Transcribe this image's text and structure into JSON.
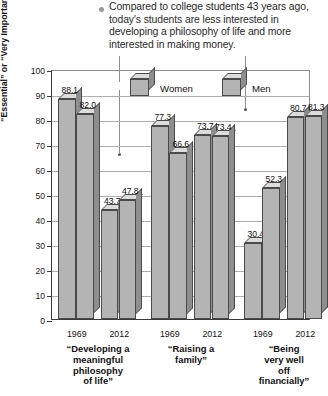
{
  "caption": {
    "bullet_icon": "bullet-dot",
    "text": "Compared to college students 43 years ago, today's students are less interested in developing a philosophy of life and more interested in making money."
  },
  "chart_data": {
    "type": "bar",
    "title": "",
    "xlabel": "",
    "ylabel": "Percentage Calling Objective “Essential” or “Very Important”",
    "ylabel_line1": "Percentage Calling Objective",
    "ylabel_line2": "“Essential” or “Very Important”",
    "ylim": [
      0,
      100
    ],
    "ytick_step": 10,
    "yticks": [
      "100",
      "90",
      "80",
      "70",
      "60",
      "50",
      "40",
      "30",
      "20",
      "10",
      "0"
    ],
    "grid": true,
    "legend_position": "top-inside",
    "legend": [
      "Women",
      "Men"
    ],
    "groups": [
      {
        "label": "“Developing a meaningful philosophy of life”",
        "label_lines": [
          "“Developing a",
          "meaningful",
          "philosophy",
          "of life”"
        ],
        "years": [
          "1969",
          "2012"
        ]
      },
      {
        "label": "“Raising a family”",
        "label_lines": [
          "“Raising a",
          "family”"
        ],
        "years": [
          "1969",
          "2012"
        ]
      },
      {
        "label": "“Being very well off financially”",
        "label_lines": [
          "“Being very well",
          "off financially”"
        ],
        "years": [
          "1969",
          "2012"
        ]
      }
    ],
    "categories": [
      "“Developing a meaningful philosophy of life” 1969",
      "“Developing a meaningful philosophy of life” 2012",
      "“Raising a family” 1969",
      "“Raising a family” 2012",
      "“Being very well off financially” 1969",
      "“Being very well off financially” 2012"
    ],
    "series": [
      {
        "name": "Women",
        "values": [
          88.1,
          43.7,
          77.3,
          73.7,
          30.4,
          80.7
        ]
      },
      {
        "name": "Men",
        "values": [
          82.0,
          47.8,
          66.6,
          73.4,
          52.3,
          81.3
        ]
      }
    ],
    "bars": [
      {
        "group": 0,
        "year": "1969",
        "series": "Women",
        "value": 88.1,
        "label": "88.1"
      },
      {
        "group": 0,
        "year": "1969",
        "series": "Men",
        "value": 82.0,
        "label": "82.0"
      },
      {
        "group": 0,
        "year": "2012",
        "series": "Women",
        "value": 43.7,
        "label": "43.7"
      },
      {
        "group": 0,
        "year": "2012",
        "series": "Men",
        "value": 47.8,
        "label": "47.8"
      },
      {
        "group": 1,
        "year": "1969",
        "series": "Women",
        "value": 77.3,
        "label": "77.3"
      },
      {
        "group": 1,
        "year": "1969",
        "series": "Men",
        "value": 66.6,
        "label": "66.6"
      },
      {
        "group": 1,
        "year": "2012",
        "series": "Women",
        "value": 73.7,
        "label": "73.7"
      },
      {
        "group": 1,
        "year": "2012",
        "series": "Men",
        "value": 73.4,
        "label": "73.4"
      },
      {
        "group": 2,
        "year": "1969",
        "series": "Women",
        "value": 30.4,
        "label": "30.4"
      },
      {
        "group": 2,
        "year": "1969",
        "series": "Men",
        "value": 52.3,
        "label": "52.3"
      },
      {
        "group": 2,
        "year": "2012",
        "series": "Women",
        "value": 80.7,
        "label": "80.7"
      },
      {
        "group": 2,
        "year": "2012",
        "series": "Men",
        "value": 81.3,
        "label": "81.3"
      }
    ],
    "colors": {
      "bar_face": "#b4b4b4",
      "bar_top": "#dcdcdc",
      "bar_side": "#8e8e8e",
      "bar_outline": "#4a4a4a",
      "axis": "#3b3b3b",
      "grid": "#aeaeae",
      "background": "#ffffff",
      "text": "#1a1a1a",
      "bullet": "#9a9a9a",
      "leader": "#8d8d8d"
    }
  }
}
